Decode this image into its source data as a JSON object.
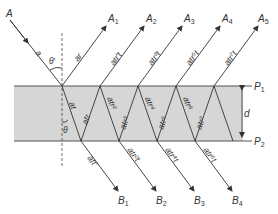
{
  "diagram": {
    "type": "multiple-beam interference in a parallel plate",
    "colors": {
      "slab_fill": "#d6d6d6",
      "line": "#333333",
      "background": "#ffffff"
    },
    "incident": {
      "label": "A",
      "amplitude_label": "a",
      "angle_outside": "θ′",
      "angle_inside": "θ"
    },
    "planes": {
      "top": {
        "label": "P",
        "sub": "1"
      },
      "bottom": {
        "label": "P",
        "sub": "2"
      },
      "thickness": "d"
    },
    "reflected": [
      {
        "label": "A",
        "sub": "1",
        "amp": "ar"
      },
      {
        "label": "A",
        "sub": "2",
        "amp": "atr′t"
      },
      {
        "label": "A",
        "sub": "3",
        "amp": "atr³t"
      },
      {
        "label": "A",
        "sub": "4",
        "amp": "atr⁵t"
      },
      {
        "label": "A",
        "sub": "5",
        "amp": "atr⁷t"
      }
    ],
    "internal": [
      "at",
      "atr",
      "atr²",
      "atr³",
      "atr⁴",
      "atr⁵",
      "atr⁶",
      "atr⁷"
    ],
    "transmitted": [
      {
        "label": "B",
        "sub": "1",
        "amp": "att′"
      },
      {
        "label": "B",
        "sub": "2",
        "amp": "atr²t"
      },
      {
        "label": "B",
        "sub": "3",
        "amp": "atr⁴t"
      },
      {
        "label": "B",
        "sub": "4",
        "amp": "atr⁶t"
      }
    ]
  }
}
